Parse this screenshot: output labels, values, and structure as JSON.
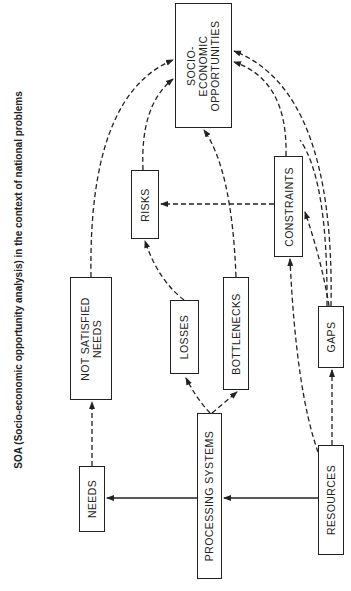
{
  "title": "SOA (Socio-economic opportunity analysis) in the context of national problems",
  "nodes": {
    "opportunities": {
      "line1": "SOCIO-",
      "line2": "ECONOMIC",
      "line3": "OPPORTUNITIES"
    },
    "risks": {
      "label": "RISKS"
    },
    "constraints": {
      "label": "CONSTRAINTS"
    },
    "not_satisfied_needs": {
      "line1": "NOT SATISFIED",
      "line2": "NEEDS"
    },
    "losses": {
      "label": "LOSSES"
    },
    "bottlenecks": {
      "label": "BOTTLENECKS"
    },
    "gaps": {
      "label": "GAPS"
    },
    "needs": {
      "label": "NEEDS"
    },
    "processing_systems": {
      "label": "PROCESSING SYSTEMS"
    },
    "resources": {
      "label": "RESOURCES"
    }
  },
  "edges": [
    {
      "from": "RESOURCES",
      "to": "PROCESSING SYSTEMS",
      "style": "solid"
    },
    {
      "from": "PROCESSING SYSTEMS",
      "to": "NEEDS",
      "style": "solid"
    },
    {
      "from": "NEEDS",
      "to": "NOT SATISFIED NEEDS",
      "style": "dashed"
    },
    {
      "from": "PROCESSING SYSTEMS",
      "to": "LOSSES",
      "style": "dashed"
    },
    {
      "from": "PROCESSING SYSTEMS",
      "to": "BOTTLENECKS",
      "style": "dashed"
    },
    {
      "from": "RESOURCES",
      "to": "GAPS",
      "style": "dashed"
    },
    {
      "from": "RESOURCES",
      "to": "CONSTRAINTS",
      "style": "dashed"
    },
    {
      "from": "GAPS",
      "to": "CONSTRAINTS",
      "style": "dashed"
    },
    {
      "from": "LOSSES",
      "to": "RISKS",
      "style": "dashed"
    },
    {
      "from": "CONSTRAINTS",
      "to": "RISKS",
      "style": "dashed"
    },
    {
      "from": "NOT SATISFIED NEEDS",
      "to": "SOCIO-ECONOMIC OPPORTUNITIES",
      "style": "dashed"
    },
    {
      "from": "RISKS",
      "to": "SOCIO-ECONOMIC OPPORTUNITIES",
      "style": "dashed"
    },
    {
      "from": "BOTTLENECKS",
      "to": "SOCIO-ECONOMIC OPPORTUNITIES",
      "style": "dashed"
    },
    {
      "from": "CONSTRAINTS",
      "to": "SOCIO-ECONOMIC OPPORTUNITIES",
      "style": "dashed"
    },
    {
      "from": "GAPS",
      "to": "SOCIO-ECONOMIC OPPORTUNITIES",
      "style": "dashed"
    }
  ]
}
